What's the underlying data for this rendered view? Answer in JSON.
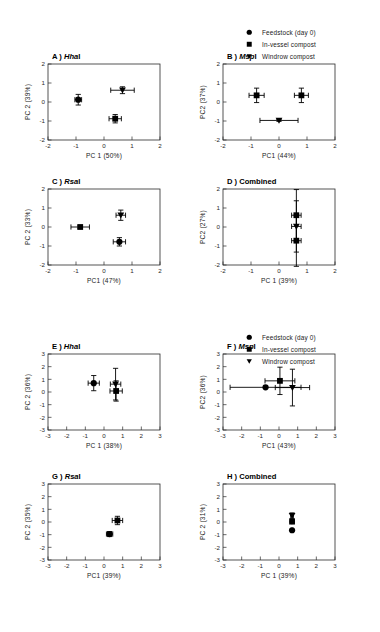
{
  "legend": {
    "items": [
      {
        "marker": "circle-marker",
        "label": "Feedstock (day 0)"
      },
      {
        "marker": "square-marker",
        "label": "In-vessel compost"
      },
      {
        "marker": "triangle-down-marker",
        "label": "Windrow compost"
      }
    ]
  },
  "chart_data": [
    {
      "id": "panel-a",
      "type": "scatter",
      "title_prefix": "A )",
      "title_italic": "Hha",
      "title_suffix": "I",
      "xlabel": "PC 1 (50%)",
      "ylabel": "PC 2 (39%)",
      "xlim": [
        -2,
        2
      ],
      "ylim": [
        -2,
        2
      ],
      "xticks": [
        -2,
        -1,
        0,
        1,
        2
      ],
      "yticks": [
        -2,
        -1,
        0,
        1,
        2
      ],
      "grid": false,
      "points": [
        {
          "name": "Feedstock (day 0)",
          "marker": "circle",
          "x": -0.92,
          "y": 0.12,
          "xerr": 0.12,
          "yerr": 0.28
        },
        {
          "name": "In-vessel compost",
          "marker": "square",
          "x": 0.4,
          "y": -0.88,
          "xerr": 0.22,
          "yerr": 0.22
        },
        {
          "name": "Windrow compost",
          "marker": "triangle",
          "x": 0.66,
          "y": 0.62,
          "xerr": 0.42,
          "yerr": 0.18
        }
      ]
    },
    {
      "id": "panel-b",
      "type": "scatter",
      "title_prefix": "B )",
      "title_italic": "Msp",
      "title_suffix": "I",
      "xlabel": "PC1 (44%)",
      "ylabel": "PC2 (37%)",
      "xlim": [
        -2,
        2
      ],
      "ylim": [
        -2,
        2
      ],
      "xticks": [
        -2,
        -1,
        0,
        1,
        2
      ],
      "yticks": [
        -2,
        -1,
        0,
        1,
        2
      ],
      "grid": false,
      "points": [
        {
          "name": "Feedstock (day 0)",
          "marker": "square",
          "x": -0.8,
          "y": 0.35,
          "xerr": 0.27,
          "yerr": 0.38
        },
        {
          "name": "In-vessel compost",
          "marker": "square",
          "x": 0.8,
          "y": 0.35,
          "xerr": 0.25,
          "yerr": 0.38
        },
        {
          "name": "Windrow compost",
          "marker": "triangle",
          "x": 0.0,
          "y": -0.97,
          "xerr": 0.68,
          "yerr": 0.05
        }
      ]
    },
    {
      "id": "panel-c",
      "type": "scatter",
      "title_prefix": "C )",
      "title_italic": "Rsa",
      "title_suffix": "I",
      "xlabel": "PC1 (47%)",
      "ylabel": "PC 2 (33%)",
      "xlim": [
        -2,
        2
      ],
      "ylim": [
        -2,
        2
      ],
      "xticks": [
        -2,
        -1,
        0,
        1,
        2
      ],
      "yticks": [
        -2,
        -1,
        0,
        1,
        2
      ],
      "grid": false,
      "points": [
        {
          "name": "Feedstock (day 0)",
          "marker": "square",
          "x": -0.85,
          "y": 0.0,
          "xerr": 0.33,
          "yerr": 0.07
        },
        {
          "name": "In-vessel compost",
          "marker": "circle",
          "x": 0.55,
          "y": -0.78,
          "xerr": 0.22,
          "yerr": 0.22
        },
        {
          "name": "Windrow compost",
          "marker": "triangle",
          "x": 0.6,
          "y": 0.62,
          "xerr": 0.17,
          "yerr": 0.27
        }
      ]
    },
    {
      "id": "panel-d",
      "type": "scatter",
      "title_prefix": "D )",
      "title_italic": "",
      "title_suffix": "Combined",
      "xlabel": "PC 1 (39%)",
      "ylabel": "PC2 (27%)",
      "xlim": [
        -2,
        2
      ],
      "ylim": [
        -2,
        2
      ],
      "xticks": [
        -2,
        -1,
        0,
        1,
        2
      ],
      "yticks": [
        -2,
        -1,
        0,
        1,
        2
      ],
      "grid": false,
      "points": [
        {
          "name": "Feedstock (day 0)",
          "marker": "square",
          "x": 0.62,
          "y": 0.62,
          "xerr": 0.17,
          "yerr": 1.35
        },
        {
          "name": "In-vessel compost",
          "marker": "triangle",
          "x": 0.62,
          "y": 0.03,
          "xerr": 0.17,
          "yerr": 1.35
        },
        {
          "name": "Windrow compost",
          "marker": "square",
          "x": 0.62,
          "y": -0.72,
          "xerr": 0.17,
          "yerr": 1.35
        }
      ]
    },
    {
      "id": "panel-e",
      "type": "scatter",
      "title_prefix": "E )",
      "title_italic": "Hha",
      "title_suffix": "I",
      "xlabel": "PC 1 (38%)",
      "ylabel": "PC 2 (36%)",
      "xlim": [
        -3,
        3
      ],
      "ylim": [
        -3,
        3
      ],
      "xticks": [
        -3,
        -2,
        -1,
        0,
        1,
        2,
        3
      ],
      "yticks": [
        -3,
        -2,
        -1,
        0,
        1,
        2,
        3
      ],
      "grid": false,
      "points": [
        {
          "name": "Feedstock (day 0)",
          "marker": "circle",
          "x": -0.55,
          "y": 0.7,
          "xerr": 0.3,
          "yerr": 0.6
        },
        {
          "name": "Windrow compost",
          "marker": "triangle",
          "x": 0.62,
          "y": 0.62,
          "xerr": 0.28,
          "yerr": 1.25
        },
        {
          "name": "In-vessel compost",
          "marker": "square",
          "x": 0.65,
          "y": 0.08,
          "xerr": 0.33,
          "yerr": 0.8
        }
      ]
    },
    {
      "id": "panel-f",
      "type": "scatter",
      "title_prefix": "F  )",
      "title_italic": "Msp",
      "title_suffix": "I",
      "xlabel": "PC1 (43%)",
      "ylabel": "PC2 (36%)",
      "xlim": [
        -3,
        3
      ],
      "ylim": [
        -3,
        3
      ],
      "xticks": [
        -3,
        -2,
        -1,
        0,
        1,
        2,
        3
      ],
      "yticks": [
        -3,
        -2,
        -1,
        0,
        1,
        2,
        3
      ],
      "grid": false,
      "points": [
        {
          "name": "Feedstock (day 0)",
          "marker": "circle",
          "x": -0.72,
          "y": 0.37,
          "xerr": 1.9,
          "yerr": 0.1
        },
        {
          "name": "In-vessel compost",
          "marker": "square",
          "x": 0.05,
          "y": 0.88,
          "xerr": 0.8,
          "yerr": 1.08
        },
        {
          "name": "Windrow compost",
          "marker": "triangle",
          "x": 0.72,
          "y": 0.35,
          "xerr": 0.92,
          "yerr": 1.45
        }
      ]
    },
    {
      "id": "panel-g",
      "type": "scatter",
      "title_prefix": "G )",
      "title_italic": "Rsa",
      "title_suffix": "I",
      "xlabel": "PC1 (39%)",
      "ylabel": "PC 2 (35%)",
      "xlim": [
        -3,
        3
      ],
      "ylim": [
        -3,
        3
      ],
      "xticks": [
        -3,
        -2,
        -1,
        0,
        1,
        2,
        3
      ],
      "yticks": [
        -3,
        -2,
        -1,
        0,
        1,
        2,
        3
      ],
      "grid": false,
      "points": [
        {
          "name": "In-vessel compost",
          "marker": "square",
          "x": 0.72,
          "y": 0.12,
          "xerr": 0.28,
          "yerr": 0.33
        },
        {
          "name": "Feedstock (day 0)",
          "marker": "circle",
          "x": 0.3,
          "y": -0.95,
          "xerr": 0.17,
          "yerr": 0.2
        }
      ]
    },
    {
      "id": "panel-h",
      "type": "scatter",
      "title_prefix": "H )",
      "title_italic": "",
      "title_suffix": "Combined",
      "xlabel": "PC 1 (39%)",
      "ylabel": "PC 2 (31%)",
      "xlim": [
        -3,
        3
      ],
      "ylim": [
        -3,
        3
      ],
      "xticks": [
        -3,
        -2,
        -1,
        0,
        1,
        2,
        3
      ],
      "yticks": [
        -3,
        -2,
        -1,
        0,
        1,
        2,
        3
      ],
      "grid": false,
      "points": [
        {
          "name": "Windrow compost",
          "marker": "triangle",
          "x": 0.7,
          "y": 0.5,
          "xerr": 0.07,
          "yerr": 0.22
        },
        {
          "name": "In-vessel compost",
          "marker": "square",
          "x": 0.7,
          "y": 0.03,
          "xerr": 0.04,
          "yerr": 0.04
        },
        {
          "name": "Feedstock (day 0)",
          "marker": "circle",
          "x": 0.7,
          "y": -0.65,
          "xerr": 0.04,
          "yerr": 0.04
        }
      ]
    }
  ]
}
